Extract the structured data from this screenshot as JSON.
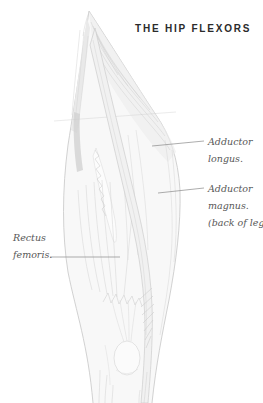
{
  "title": "THE HIP FLEXORS",
  "labels": {
    "adductor_longus": {
      "lines": [
        "Adductor",
        "longus."
      ]
    },
    "adductor_magnus": {
      "lines": [
        "Adductor",
        "magnus.",
        "(back of leg)"
      ]
    },
    "rectus_femoris": {
      "lines": [
        "Rectus",
        "femoris."
      ]
    }
  },
  "colors": {
    "background": "#ffffff",
    "title_text": "#2b2b2b",
    "label_text": "#575757",
    "leader_line": "#8a8a8a",
    "sketch_stroke": "#c6c6c6",
    "sketch_shade": "#e9e9e9"
  }
}
